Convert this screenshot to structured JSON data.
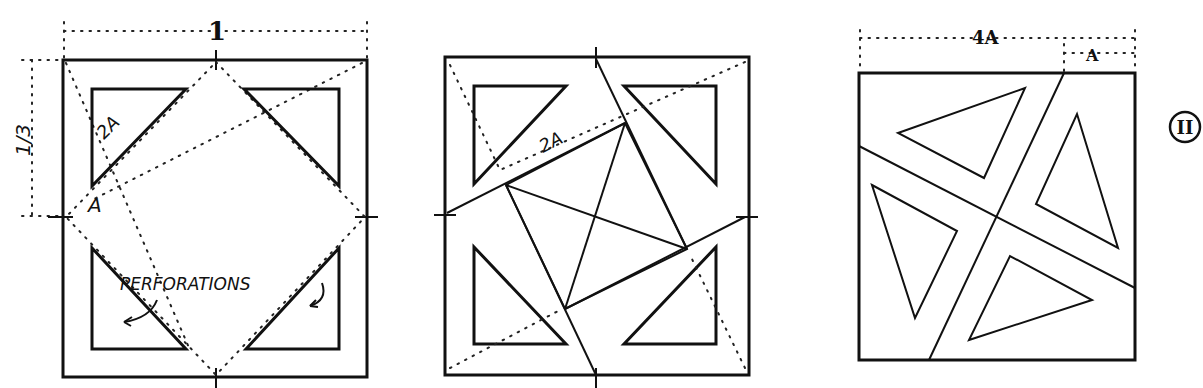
{
  "figure_id": "II",
  "panels": [
    {
      "id": "left",
      "labels": {
        "width": "1",
        "height_fraction": "1/3",
        "diag_label": "2A",
        "small_label": "A",
        "annotation": "PERFORATIONS"
      }
    },
    {
      "id": "middle",
      "labels": {
        "diag_label": "2A"
      }
    },
    {
      "id": "right",
      "labels": {
        "top_dim": "4A",
        "top_dim_small": "A"
      }
    }
  ]
}
